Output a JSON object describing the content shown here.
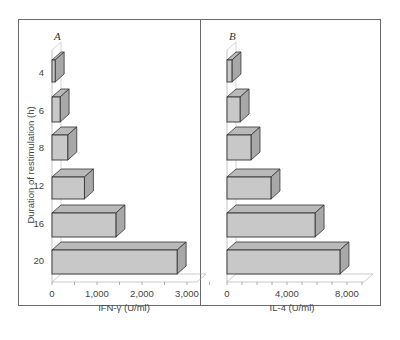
{
  "chart_data": [
    {
      "type": "bar",
      "orientation": "horizontal",
      "style": "3d",
      "panel": "A",
      "title": "A",
      "categories": [
        "4",
        "6",
        "8",
        "12",
        "16",
        "20"
      ],
      "values": [
        70,
        180,
        350,
        720,
        1420,
        2780
      ],
      "xlabel": "IFN-γ (U/ml)",
      "ylabel": "Duration of restimulation (h)",
      "xticks": [
        "0",
        "1,000",
        "2,000",
        "3,000"
      ],
      "xlim": [
        0,
        3500
      ],
      "grid": false
    },
    {
      "type": "bar",
      "orientation": "horizontal",
      "style": "3d",
      "panel": "B",
      "title": "B",
      "categories": [
        "4",
        "6",
        "8",
        "12",
        "16",
        "20"
      ],
      "values": [
        330,
        870,
        1600,
        2930,
        5870,
        7530
      ],
      "xlabel": "IL-4 (U/ml)",
      "ylabel": "",
      "xticks": [
        "0",
        "4,000",
        "8,000"
      ],
      "xlim": [
        0,
        9000
      ],
      "grid": false
    }
  ],
  "panels": {
    "a": {
      "label": "A",
      "xlabel": "IFN-γ (U/ml)",
      "ticks": [
        "0",
        "1,000",
        "2,000",
        "3,000"
      ]
    },
    "b": {
      "label": "B",
      "xlabel": "IL-4 (U/ml)",
      "ticks": [
        "0",
        "4,000",
        "8,000"
      ]
    }
  },
  "ylabel": "Duration of restimulation (h)",
  "categories": [
    "4",
    "6",
    "8",
    "12",
    "16",
    "20"
  ],
  "colors": {
    "bar_front": "#c8c8c8",
    "bar_top": "#b9b9b9",
    "bar_side": "#a8a8a8",
    "outline": "#333333",
    "frame": "#6a6a6a"
  }
}
